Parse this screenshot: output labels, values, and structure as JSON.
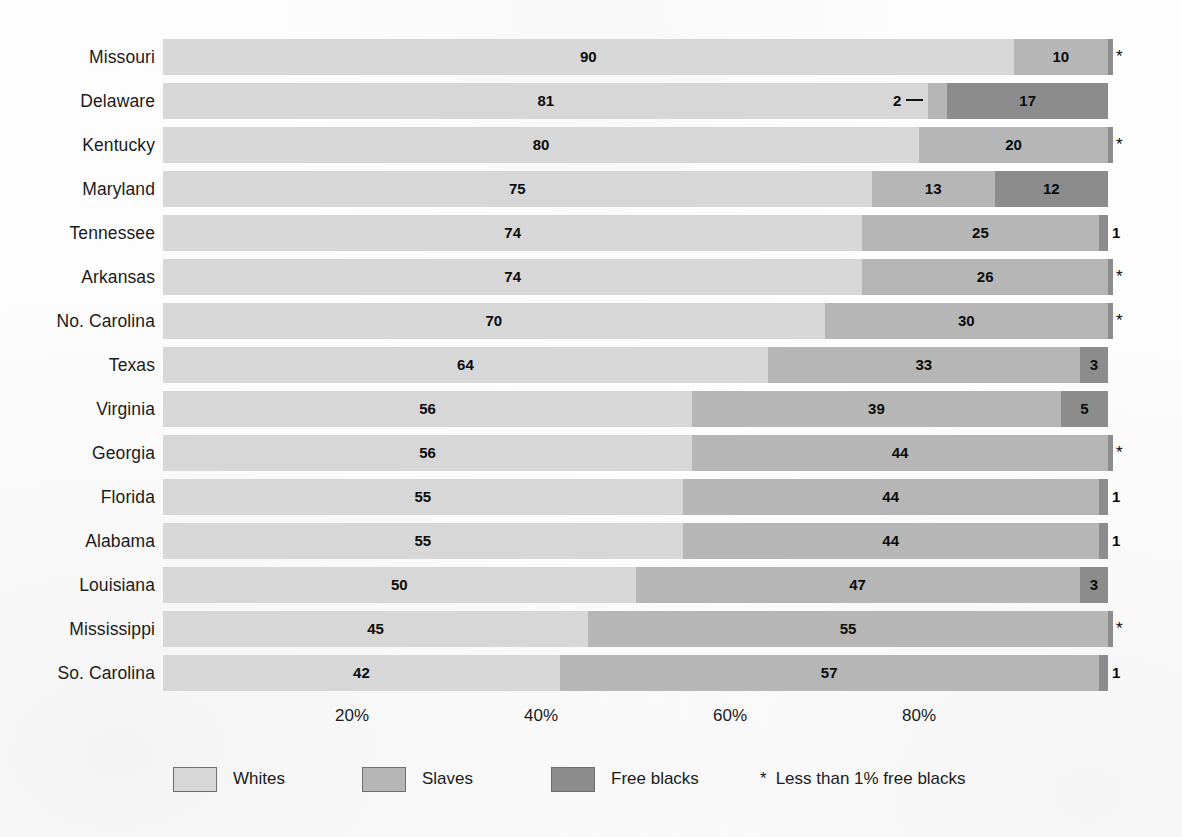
{
  "chart_data": {
    "type": "bar",
    "subtype": "stacked-horizontal-percent",
    "title": "",
    "xlabel": "",
    "ylabel": "",
    "xlim": [
      0,
      100
    ],
    "grid": false,
    "legend_position": "bottom",
    "tick_labels": [
      "20%",
      "40%",
      "60%",
      "80%"
    ],
    "tick_values": [
      20,
      40,
      60,
      80
    ],
    "series": [
      {
        "name": "Whites",
        "color": "#d7d7d7",
        "values": [
          90,
          81,
          80,
          75,
          74,
          74,
          70,
          64,
          56,
          56,
          55,
          55,
          50,
          45,
          42
        ]
      },
      {
        "name": "Slaves",
        "color": "#b6b6b6",
        "values": [
          10,
          2,
          20,
          13,
          25,
          26,
          30,
          33,
          39,
          44,
          44,
          44,
          47,
          55,
          57
        ]
      },
      {
        "name": "Free blacks",
        "color": "#8c8c8c",
        "values": [
          0.5,
          17,
          0.5,
          12,
          1,
          0.5,
          0.5,
          3,
          5,
          0.5,
          1,
          1,
          3,
          0.5,
          1
        ]
      }
    ],
    "categories": [
      "Missouri",
      "Delaware",
      "Kentucky",
      "Maryland",
      "Tennessee",
      "Arkansas",
      "No. Carolina",
      "Texas",
      "Virginia",
      "Georgia",
      "Florida",
      "Alabama",
      "Louisiana",
      "Mississippi",
      "So. Carolina"
    ],
    "annotations": [
      "* Less than 1% free blacks"
    ]
  },
  "rows": [
    {
      "state": "Missouri",
      "whites": 90,
      "slaves": 10,
      "free": 0.5,
      "whites_label": "90",
      "slaves_label": "10",
      "free_label": "",
      "marker": "*",
      "marker_type": "star",
      "slaves_callout": false
    },
    {
      "state": "Delaware",
      "whites": 81,
      "slaves": 2,
      "free": 17,
      "whites_label": "81",
      "slaves_label": "2",
      "free_label": "17",
      "marker": "",
      "marker_type": "none",
      "slaves_callout": true
    },
    {
      "state": "Kentucky",
      "whites": 80,
      "slaves": 20,
      "free": 0.5,
      "whites_label": "80",
      "slaves_label": "20",
      "free_label": "",
      "marker": "*",
      "marker_type": "star",
      "slaves_callout": false
    },
    {
      "state": "Maryland",
      "whites": 75,
      "slaves": 13,
      "free": 12,
      "whites_label": "75",
      "slaves_label": "13",
      "free_label": "12",
      "marker": "",
      "marker_type": "none",
      "slaves_callout": false
    },
    {
      "state": "Tennessee",
      "whites": 74,
      "slaves": 25,
      "free": 1,
      "whites_label": "74",
      "slaves_label": "25",
      "free_label": "",
      "marker": "1",
      "marker_type": "num",
      "slaves_callout": false
    },
    {
      "state": "Arkansas",
      "whites": 74,
      "slaves": 26,
      "free": 0.5,
      "whites_label": "74",
      "slaves_label": "26",
      "free_label": "",
      "marker": "*",
      "marker_type": "star",
      "slaves_callout": false
    },
    {
      "state": "No. Carolina",
      "whites": 70,
      "slaves": 30,
      "free": 0.5,
      "whites_label": "70",
      "slaves_label": "30",
      "free_label": "",
      "marker": "*",
      "marker_type": "star",
      "slaves_callout": false
    },
    {
      "state": "Texas",
      "whites": 64,
      "slaves": 33,
      "free": 3,
      "whites_label": "64",
      "slaves_label": "33",
      "free_label": "3",
      "marker": "",
      "marker_type": "none",
      "slaves_callout": false
    },
    {
      "state": "Virginia",
      "whites": 56,
      "slaves": 39,
      "free": 5,
      "whites_label": "56",
      "slaves_label": "39",
      "free_label": "5",
      "marker": "",
      "marker_type": "none",
      "slaves_callout": false
    },
    {
      "state": "Georgia",
      "whites": 56,
      "slaves": 44,
      "free": 0.5,
      "whites_label": "56",
      "slaves_label": "44",
      "free_label": "",
      "marker": "*",
      "marker_type": "star",
      "slaves_callout": false
    },
    {
      "state": "Florida",
      "whites": 55,
      "slaves": 44,
      "free": 1,
      "whites_label": "55",
      "slaves_label": "44",
      "free_label": "",
      "marker": "1",
      "marker_type": "num",
      "slaves_callout": false
    },
    {
      "state": "Alabama",
      "whites": 55,
      "slaves": 44,
      "free": 1,
      "whites_label": "55",
      "slaves_label": "44",
      "free_label": "",
      "marker": "1",
      "marker_type": "num",
      "slaves_callout": false
    },
    {
      "state": "Louisiana",
      "whites": 50,
      "slaves": 47,
      "free": 3,
      "whites_label": "50",
      "slaves_label": "47",
      "free_label": "3",
      "marker": "",
      "marker_type": "none",
      "slaves_callout": false
    },
    {
      "state": "Mississippi",
      "whites": 45,
      "slaves": 55,
      "free": 0.5,
      "whites_label": "45",
      "slaves_label": "55",
      "free_label": "",
      "marker": "*",
      "marker_type": "star",
      "slaves_callout": false
    },
    {
      "state": "So. Carolina",
      "whites": 42,
      "slaves": 57,
      "free": 1,
      "whites_label": "42",
      "slaves_label": "57",
      "free_label": "",
      "marker": "1",
      "marker_type": "num",
      "slaves_callout": false
    }
  ],
  "axis": {
    "ticks": [
      {
        "label": "20%",
        "value": 20
      },
      {
        "label": "40%",
        "value": 40
      },
      {
        "label": "60%",
        "value": 60
      },
      {
        "label": "80%",
        "value": 80
      }
    ]
  },
  "legend": {
    "items": [
      {
        "label": "Whites",
        "color": "#d7d7d7"
      },
      {
        "label": "Slaves",
        "color": "#b6b6b6"
      },
      {
        "label": "Free blacks",
        "color": "#8c8c8c"
      }
    ],
    "footnote_symbol": "*",
    "footnote": "Less than 1% free blacks"
  },
  "colors": {
    "whites": "#d7d7d7",
    "slaves": "#b6b6b6",
    "free_blacks": "#8c8c8c",
    "text": "#1b1b1b",
    "background": "#fdfdfd"
  }
}
